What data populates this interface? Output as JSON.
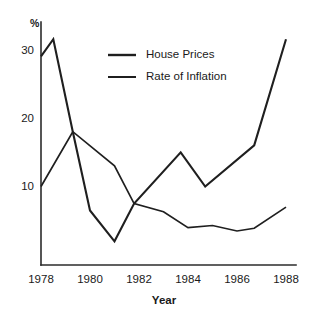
{
  "chart_data": {
    "type": "line",
    "title": "",
    "xlabel": "Year",
    "ylabel": "%",
    "xlim": [
      1978,
      1988
    ],
    "ylim": [
      0,
      33
    ],
    "grid": false,
    "legend_position": "top-center",
    "xticks": [
      "1978",
      "1980",
      "1982",
      "1984",
      "1986",
      "1988"
    ],
    "xtick_values": [
      1978,
      1980,
      1982,
      1984,
      1986,
      1988
    ],
    "yticks": [
      "10",
      "20",
      "30"
    ],
    "ytick_values": [
      10,
      20,
      30
    ],
    "series": [
      {
        "name": "House Prices",
        "x": [
          1978.0,
          1978.5,
          1979.3,
          1980.0,
          1981.0,
          1981.8,
          1983.7,
          1984.7,
          1986.7,
          1988.0
        ],
        "values": [
          29.0,
          31.5,
          18.0,
          6.5,
          2.0,
          7.5,
          15.0,
          10.0,
          16.0,
          31.5
        ]
      },
      {
        "name": "Rate of Inflation",
        "x": [
          1978.0,
          1979.3,
          1981.0,
          1981.8,
          1983.0,
          1984.0,
          1985.0,
          1986.0,
          1986.7,
          1988.0
        ],
        "values": [
          10.0,
          18.0,
          13.0,
          7.5,
          6.3,
          4.0,
          4.3,
          3.5,
          3.9,
          7.0
        ]
      }
    ]
  },
  "axes": {
    "y_axis_label": "%",
    "x_axis_title": "Year"
  },
  "legend": {
    "items": [
      {
        "label": "House Prices"
      },
      {
        "label": "Rate of Inflation"
      }
    ]
  },
  "colors": {
    "line": "#1f1f1f",
    "axis": "#2b2b2b",
    "background": "#ffffff",
    "text": "#1a1a1a"
  }
}
